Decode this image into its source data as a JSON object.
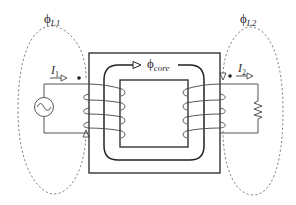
{
  "diagram": {
    "type": "transformer-schematic",
    "labels": {
      "leakage_flux_primary": {
        "symbol": "ϕ",
        "subscript": "L1"
      },
      "leakage_flux_secondary": {
        "symbol": "ϕ",
        "subscript": "L2"
      },
      "core_flux": {
        "symbol": "ϕ",
        "subscript": "core"
      },
      "primary_current": {
        "symbol": "I",
        "subscript": "1"
      },
      "secondary_current": {
        "symbol": "I",
        "subscript": "2"
      }
    },
    "components": {
      "source": "ac-voltage-source",
      "load": "resistor",
      "core": "square-magnetic-core",
      "primary_winding_turns": 4,
      "secondary_winding_turns": 4
    },
    "colors": {
      "stroke": "#333333",
      "dashed": "#777777",
      "background": "#ffffff"
    }
  }
}
